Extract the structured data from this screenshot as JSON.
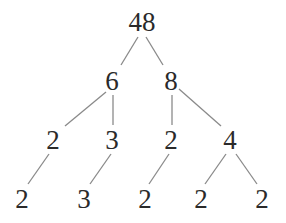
{
  "diagram": {
    "type": "factor-tree",
    "colors": {
      "text": "#2a2a2a",
      "edge": "#8a8a8a",
      "background": "#ffffff"
    },
    "nodes": [
      {
        "id": "n48",
        "label": "48",
        "x": 142,
        "y": 22
      },
      {
        "id": "n6",
        "label": "6",
        "x": 112,
        "y": 81
      },
      {
        "id": "n8",
        "label": "8",
        "x": 171,
        "y": 81
      },
      {
        "id": "n2a",
        "label": "2",
        "x": 53,
        "y": 140
      },
      {
        "id": "n3a",
        "label": "3",
        "x": 112,
        "y": 140
      },
      {
        "id": "n2b",
        "label": "2",
        "x": 171,
        "y": 140
      },
      {
        "id": "n4",
        "label": "4",
        "x": 230,
        "y": 140
      },
      {
        "id": "n2c",
        "label": "2",
        "x": 22,
        "y": 199
      },
      {
        "id": "n3b",
        "label": "3",
        "x": 84,
        "y": 199
      },
      {
        "id": "n2d",
        "label": "2",
        "x": 145,
        "y": 199
      },
      {
        "id": "n2e",
        "label": "2",
        "x": 201,
        "y": 199
      },
      {
        "id": "n2f",
        "label": "2",
        "x": 262,
        "y": 199
      }
    ],
    "edges": [
      {
        "from": "n48",
        "to": "n6",
        "x1": 138,
        "y1": 37,
        "x2": 121,
        "y2": 65
      },
      {
        "from": "n48",
        "to": "n8",
        "x1": 146,
        "y1": 37,
        "x2": 163,
        "y2": 65
      },
      {
        "from": "n6",
        "to": "n2a",
        "x1": 106,
        "y1": 92,
        "x2": 65,
        "y2": 126
      },
      {
        "from": "n6",
        "to": "n3a",
        "x1": 113,
        "y1": 95,
        "x2": 113,
        "y2": 125
      },
      {
        "from": "n8",
        "to": "n2b",
        "x1": 172,
        "y1": 95,
        "x2": 172,
        "y2": 125
      },
      {
        "from": "n8",
        "to": "n4",
        "x1": 179,
        "y1": 89,
        "x2": 221,
        "y2": 126
      },
      {
        "from": "n2a",
        "to": "n2c",
        "x1": 49,
        "y1": 154,
        "x2": 28,
        "y2": 184
      },
      {
        "from": "n3a",
        "to": "n3b",
        "x1": 111,
        "y1": 154,
        "x2": 90,
        "y2": 184
      },
      {
        "from": "n2b",
        "to": "n2d",
        "x1": 169,
        "y1": 154,
        "x2": 149,
        "y2": 184
      },
      {
        "from": "n4",
        "to": "n2e",
        "x1": 226,
        "y1": 154,
        "x2": 205,
        "y2": 184
      },
      {
        "from": "n4",
        "to": "n2f",
        "x1": 236,
        "y1": 154,
        "x2": 257,
        "y2": 184
      }
    ]
  }
}
